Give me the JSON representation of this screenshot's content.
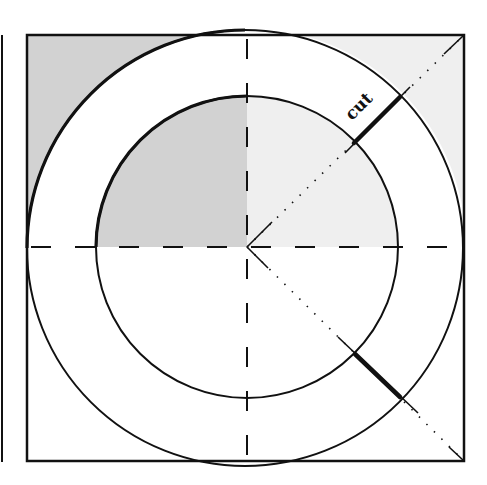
{
  "diagram": {
    "title": "",
    "labels": {
      "cut": "cut"
    },
    "geometry": {
      "page_edge_x": 2,
      "square": {
        "x": 27,
        "y": 35,
        "size": 437
      },
      "center": {
        "x": 247,
        "y": 247
      },
      "outer_radius": 219,
      "inner_radius": 151
    },
    "cuts": [
      {
        "name": "upper-right-cut",
        "from": [
          354,
          143
        ],
        "to": [
          400,
          97
        ]
      },
      {
        "name": "lower-right-cut",
        "from": [
          355,
          354
        ],
        "to": [
          400,
          397
        ]
      }
    ],
    "colors": {
      "line": "#111111",
      "shade_dark": "#d2d2d2",
      "shade_light": "#efefef",
      "background": "#ffffff"
    }
  }
}
